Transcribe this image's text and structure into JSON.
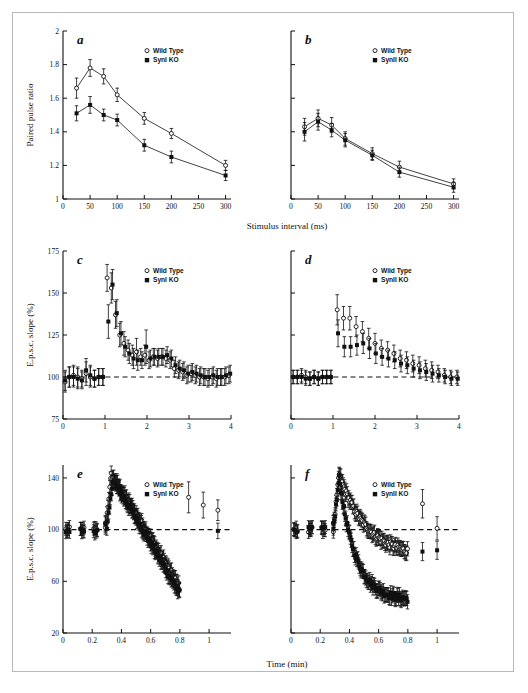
{
  "figure": {
    "background": "#ffffff",
    "frame_color": "#b9b9b9",
    "marker_color": "#111111",
    "caption_fragment": "",
    "legend": {
      "wild_type_label": "Wild Type",
      "syn1_label": "SynI KO",
      "syn2_label": "SynII KO",
      "open_marker": "circle-open",
      "filled_marker": "square-filled"
    }
  },
  "chart_data": [
    {
      "id": "a",
      "panel_letter": "a",
      "type": "line",
      "title": "",
      "xlabel": "Stimulus interval (ms)",
      "ylabel": "Paired pulse ratio",
      "xlim": [
        0,
        310
      ],
      "ylim": [
        1,
        2
      ],
      "xticks": [
        0,
        50,
        100,
        150,
        200,
        250,
        300
      ],
      "xticklabels": [
        "0",
        "50",
        "100",
        "150",
        "200",
        "250",
        "300"
      ],
      "yticks": [
        1,
        1.2,
        1.4,
        1.6,
        1.8,
        2
      ],
      "yticklabels": [
        "1",
        "1.2",
        "1.4",
        "1.6",
        "1.8",
        "2"
      ],
      "grid": false,
      "legend_position": "upper-right",
      "x": [
        25,
        50,
        75,
        100,
        150,
        200,
        300
      ],
      "series": [
        {
          "name": "Wild Type",
          "marker": "circle-open",
          "values": [
            1.66,
            1.78,
            1.73,
            1.62,
            1.48,
            1.39,
            1.2
          ],
          "errors": [
            0.06,
            0.05,
            0.045,
            0.04,
            0.035,
            0.03,
            0.03
          ]
        },
        {
          "name": "SynI KO",
          "marker": "square-filled",
          "values": [
            1.51,
            1.56,
            1.5,
            1.47,
            1.32,
            1.25,
            1.14
          ],
          "errors": [
            0.045,
            0.05,
            0.035,
            0.035,
            0.035,
            0.035,
            0.03
          ]
        }
      ]
    },
    {
      "id": "b",
      "panel_letter": "b",
      "type": "line",
      "title": "",
      "xlabel": "Stimulus interval (ms)",
      "ylabel": "Paired pulse ratio",
      "xlim": [
        0,
        310
      ],
      "ylim": [
        1,
        2
      ],
      "xticks": [
        0,
        50,
        100,
        150,
        200,
        250,
        300
      ],
      "xticklabels": [
        "0",
        "50",
        "100",
        "150",
        "200",
        "250",
        "300"
      ],
      "yticks": [
        1,
        1.2,
        1.4,
        1.6,
        1.8,
        2
      ],
      "yticklabels": [
        "",
        "",
        "",
        "",
        "",
        ""
      ],
      "grid": false,
      "legend_position": "upper-right",
      "x": [
        25,
        50,
        75,
        100,
        150,
        200,
        300
      ],
      "series": [
        {
          "name": "Wild Type",
          "marker": "circle-open",
          "values": [
            1.43,
            1.48,
            1.44,
            1.36,
            1.27,
            1.19,
            1.09
          ],
          "errors": [
            0.05,
            0.05,
            0.045,
            0.04,
            0.035,
            0.035,
            0.03
          ]
        },
        {
          "name": "SynII KO",
          "marker": "square-filled",
          "values": [
            1.4,
            1.46,
            1.41,
            1.35,
            1.26,
            1.16,
            1.07
          ],
          "errors": [
            0.055,
            0.05,
            0.04,
            0.04,
            0.03,
            0.03,
            0.03
          ]
        }
      ]
    },
    {
      "id": "c",
      "panel_letter": "c",
      "type": "scatter",
      "title": "",
      "xlabel": "",
      "ylabel": "E.p.s.c. slope (%)",
      "xlim": [
        0,
        4
      ],
      "ylim": [
        75,
        175
      ],
      "xticks": [
        0,
        1,
        2,
        3,
        4
      ],
      "xticklabels": [
        "0",
        "1",
        "2",
        "3",
        "4"
      ],
      "yticks": [
        75,
        100,
        125,
        150,
        175
      ],
      "yticklabels": [
        "75",
        "100",
        "125",
        "150",
        "175"
      ],
      "grid": false,
      "baseline": 100,
      "legend_position": "upper-right",
      "series": [
        {
          "name": "Wild Type",
          "marker": "circle-open",
          "x": [
            0.05,
            0.15,
            0.25,
            0.35,
            0.45,
            0.55,
            0.65,
            0.75,
            0.85,
            0.95,
            1.05,
            1.15,
            1.25,
            1.35,
            1.45,
            1.55,
            1.65,
            1.75,
            1.85,
            1.95,
            2.05,
            2.15,
            2.25,
            2.35,
            2.45,
            2.55,
            2.65,
            2.75,
            2.85,
            2.95,
            3.05,
            3.15,
            3.25,
            3.35,
            3.45,
            3.55,
            3.65,
            3.75,
            3.85,
            3.95
          ],
          "values": [
            97,
            100,
            101,
            100,
            99,
            102,
            100,
            99,
            100,
            100,
            159,
            153,
            137,
            125,
            120,
            116,
            113,
            115,
            112,
            113,
            110,
            112,
            111,
            112,
            111,
            110,
            105,
            104,
            103,
            101,
            102,
            101,
            100,
            100,
            99,
            100,
            99,
            100,
            100,
            101
          ],
          "errors": [
            6,
            6,
            6,
            6,
            5,
            7,
            6,
            5,
            5,
            5,
            8,
            9,
            8,
            7,
            7,
            6,
            6,
            8,
            5,
            6,
            5,
            5,
            5,
            5,
            5,
            5,
            5,
            5,
            5,
            5,
            5,
            5,
            5,
            5,
            5,
            5,
            5,
            5,
            5,
            5
          ]
        },
        {
          "name": "SynI KO",
          "marker": "square-filled",
          "x": [
            0.05,
            0.15,
            0.25,
            0.35,
            0.45,
            0.55,
            0.65,
            0.75,
            0.85,
            0.95,
            1.08,
            1.18,
            1.28,
            1.38,
            1.48,
            1.58,
            1.68,
            1.78,
            1.88,
            1.98,
            2.08,
            2.18,
            2.28,
            2.38,
            2.48,
            2.58,
            2.68,
            2.78,
            2.88,
            2.98,
            3.08,
            3.18,
            3.28,
            3.38,
            3.48,
            3.58,
            3.68,
            3.78,
            3.88,
            3.98
          ],
          "values": [
            98,
            100,
            100,
            99,
            98,
            104,
            101,
            99,
            100,
            100,
            133,
            155,
            138,
            126,
            118,
            114,
            111,
            110,
            110,
            118,
            111,
            112,
            112,
            112,
            113,
            111,
            107,
            105,
            104,
            102,
            103,
            102,
            101,
            100,
            100,
            101,
            100,
            100,
            101,
            102
          ],
          "errors": [
            6,
            6,
            6,
            6,
            5,
            7,
            6,
            5,
            5,
            5,
            10,
            9,
            8,
            7,
            6,
            6,
            6,
            6,
            5,
            10,
            5,
            5,
            5,
            5,
            5,
            5,
            5,
            5,
            5,
            5,
            5,
            5,
            5,
            5,
            5,
            5,
            5,
            5,
            5,
            5
          ]
        }
      ]
    },
    {
      "id": "d",
      "panel_letter": "d",
      "type": "scatter",
      "title": "",
      "xlabel": "",
      "ylabel": "E.p.s.c. slope (%)",
      "xlim": [
        0,
        4
      ],
      "ylim": [
        75,
        175
      ],
      "xticks": [
        0,
        1,
        2,
        3,
        4
      ],
      "xticklabels": [
        "0",
        "1",
        "2",
        "3",
        "4"
      ],
      "yticks": [
        75,
        100,
        125,
        150,
        175
      ],
      "yticklabels": [
        "",
        "",
        "",
        "",
        ""
      ],
      "grid": false,
      "baseline": 100,
      "legend_position": "upper-right",
      "series": [
        {
          "name": "Wild Type",
          "marker": "circle-open",
          "x": [
            0.05,
            0.15,
            0.25,
            0.35,
            0.45,
            0.55,
            0.65,
            0.75,
            0.85,
            0.95,
            1.1,
            1.25,
            1.4,
            1.55,
            1.7,
            1.85,
            2.0,
            2.15,
            2.3,
            2.45,
            2.6,
            2.75,
            2.9,
            3.05,
            3.2,
            3.35,
            3.5,
            3.65,
            3.8,
            3.95
          ],
          "values": [
            100,
            100,
            101,
            100,
            99,
            100,
            99,
            100,
            100,
            100,
            140,
            135,
            135,
            130,
            127,
            123,
            120,
            117,
            116,
            114,
            111,
            110,
            108,
            107,
            105,
            104,
            103,
            101,
            100,
            100
          ],
          "errors": [
            4,
            4,
            4,
            4,
            4,
            4,
            4,
            4,
            4,
            4,
            9,
            7,
            7,
            6,
            6,
            6,
            6,
            5,
            5,
            5,
            5,
            5,
            5,
            5,
            5,
            5,
            4,
            4,
            4,
            4
          ]
        },
        {
          "name": "SynII KO",
          "marker": "square-filled",
          "x": [
            0.05,
            0.15,
            0.25,
            0.35,
            0.45,
            0.55,
            0.65,
            0.75,
            0.85,
            0.95,
            1.12,
            1.27,
            1.42,
            1.57,
            1.72,
            1.87,
            2.02,
            2.17,
            2.32,
            2.47,
            2.62,
            2.77,
            2.92,
            3.07,
            3.22,
            3.37,
            3.52,
            3.67,
            3.82,
            3.97
          ],
          "values": [
            100,
            100,
            100,
            99,
            99,
            100,
            99,
            100,
            100,
            100,
            126,
            118,
            118,
            119,
            120,
            117,
            114,
            112,
            111,
            110,
            108,
            107,
            105,
            104,
            103,
            102,
            101,
            100,
            99,
            99
          ],
          "errors": [
            4,
            4,
            4,
            4,
            4,
            4,
            4,
            4,
            4,
            4,
            8,
            6,
            6,
            6,
            6,
            6,
            6,
            5,
            5,
            5,
            5,
            5,
            5,
            5,
            5,
            5,
            4,
            4,
            4,
            4
          ]
        }
      ]
    },
    {
      "id": "e",
      "panel_letter": "e",
      "type": "scatter",
      "title": "",
      "xlabel": "Time (min)",
      "ylabel": "E.p.s.c. slope (%)",
      "xlim": [
        0,
        1.15
      ],
      "ylim": [
        20,
        150
      ],
      "xticks": [
        0,
        0.2,
        0.4,
        0.6,
        0.8,
        1
      ],
      "xticklabels": [
        "0",
        "0.2",
        "0.4",
        "0.6",
        "0.8",
        "1"
      ],
      "yticks": [
        20,
        60,
        100,
        140
      ],
      "yticklabels": [
        "20",
        "60",
        "100",
        "140"
      ],
      "grid": false,
      "baseline": 100,
      "legend_position": "upper-right",
      "series": [
        {
          "name": "Wild Type",
          "marker": "circle-open",
          "description": "dense baseline then potentiation to ~140 then slow decay to ~55; isolated points near 0.86, 0.96, 1.06",
          "baseline_value": 100,
          "peak_value": 142,
          "peak_time": 0.33,
          "end_value": 55,
          "end_time": 0.8,
          "tail_x": [
            0.86,
            0.96,
            1.06
          ],
          "tail_values": [
            125,
            119,
            115
          ],
          "tail_errors": [
            12,
            10,
            8
          ]
        },
        {
          "name": "SynI KO",
          "marker": "square-filled",
          "description": "overlapping dense cloud with wild type",
          "baseline_value": 99,
          "peak_value": 138,
          "peak_time": 0.34,
          "end_value": 50,
          "end_time": 0.8,
          "tail_x": [
            1.06
          ],
          "tail_values": [
            99
          ],
          "tail_errors": [
            6
          ]
        }
      ]
    },
    {
      "id": "f",
      "panel_letter": "f",
      "type": "scatter",
      "title": "",
      "xlabel": "Time (min)",
      "ylabel": "E.p.s.c. slope (%)",
      "xlim": [
        0,
        1.15
      ],
      "ylim": [
        20,
        150
      ],
      "xticks": [
        0,
        0.2,
        0.4,
        0.6,
        0.8,
        1
      ],
      "xticklabels": [
        "0",
        "0.2",
        "0.4",
        "0.6",
        "0.8",
        "1"
      ],
      "yticks": [
        20,
        60,
        100,
        140
      ],
      "yticklabels": [
        "",
        "",
        "",
        ""
      ],
      "grid": false,
      "baseline": 100,
      "legend_position": "upper-right",
      "series": [
        {
          "name": "Wild Type",
          "marker": "circle-open",
          "description": "upper decay branch from ~143 peak to ~78 at 0.8",
          "baseline_value": 100,
          "peak_value": 143,
          "peak_time": 0.33,
          "end_value": 78,
          "end_time": 0.8,
          "tail_x": [
            0.9,
            1.0
          ],
          "tail_values": [
            120,
            101
          ],
          "tail_errors": [
            11,
            9
          ]
        },
        {
          "name": "SynII KO",
          "marker": "square-filled",
          "description": "lower steeper decay branch from ~140 peak to ~45 at 0.8",
          "baseline_value": 100,
          "peak_value": 140,
          "peak_time": 0.33,
          "end_value": 45,
          "end_time": 0.8,
          "tail_x": [
            0.9,
            1.0
          ],
          "tail_values": [
            83,
            84
          ],
          "tail_errors": [
            7,
            7
          ]
        }
      ]
    }
  ]
}
